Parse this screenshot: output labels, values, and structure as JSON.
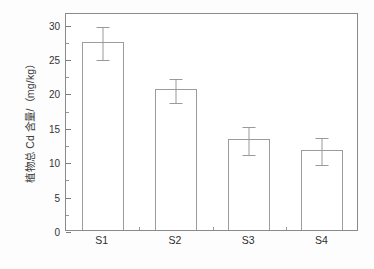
{
  "chart_data": {
    "type": "bar",
    "title": "",
    "subtitle": "",
    "xlabel": "",
    "ylabel": "植物总 Cd 含量/（mg/kg）",
    "categories": [
      "S1",
      "S2",
      "S3",
      "S4"
    ],
    "values": [
      27.4,
      20.5,
      13.2,
      11.7
    ],
    "errors": [
      2.4,
      1.8,
      2.0,
      1.9
    ],
    "series": [
      {
        "name": "植物总 Cd 含量",
        "values": [
          27.4,
          20.5,
          13.2,
          11.7
        ],
        "errors": [
          2.4,
          1.8,
          2.0,
          1.9
        ]
      }
    ],
    "ylim": [
      0,
      31.7
    ],
    "ytick_values": [
      0,
      5,
      10,
      15,
      20,
      25,
      30
    ],
    "ytick_labels": [
      "0",
      "5",
      "10",
      "15",
      "20",
      "25",
      "30"
    ],
    "yminor_values": [
      2.5,
      7.5,
      12.5,
      17.5,
      22.5,
      27.5
    ],
    "grid": false,
    "legend": null,
    "legend_position": "none",
    "annotations": [],
    "error_bar_style": "symmetric-caps",
    "bar_fill": "#ffffff",
    "bar_edge": "#9c9c9c",
    "axis_color": "#8a8a8a"
  },
  "colors": {
    "background": "#fdfdfd",
    "plot_background": "#ffffff",
    "axis": "#8a8a8a",
    "bar_edge": "#9c9c9c",
    "bar_fill": "#ffffff",
    "error_bar": "#9a9a9a",
    "tick_label": "#333333",
    "axis_label": "#3a3a3a"
  }
}
